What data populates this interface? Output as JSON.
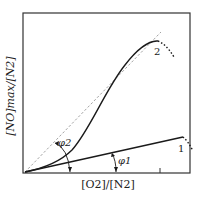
{
  "diagram": {
    "y_axis_label": "[NO]max/[N2]",
    "x_axis_label": "[O2]/[N2]",
    "curves": [
      {
        "id": "1",
        "label": "1",
        "angle_label": "φ1"
      },
      {
        "id": "2",
        "label": "2",
        "angle_label": "φ2"
      }
    ],
    "colors": {
      "curve": "#1a1a1a",
      "dashed": "#999999",
      "frame": "#333333"
    }
  }
}
